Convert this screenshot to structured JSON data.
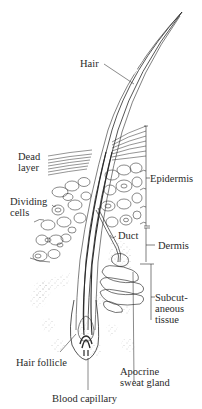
{
  "diagram": {
    "type": "anatomical-illustration",
    "colors": {
      "ink": "#2a2a2a",
      "background": "#ffffff",
      "stipple": "#9a9a9a"
    },
    "labels": {
      "hair": "Hair",
      "dead_layer": "Dead\nlayer",
      "epidermis": "Epidermis",
      "dividing_cells": "Dividing\ncells",
      "duct": "Duct",
      "dermis": "Dermis",
      "subcutaneous_tissue": "Subcut-\naneous\ntissue",
      "hair_follicle": "Hair follicle",
      "apocrine_sweat_gland": "Apocrine\nsweat gland",
      "blood_capillary": "Blood capillary"
    }
  }
}
